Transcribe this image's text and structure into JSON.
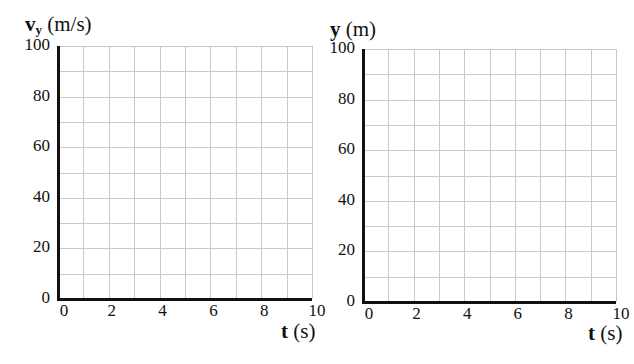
{
  "chart_data": [
    {
      "type": "line",
      "title": "",
      "ylabel": "vy (m/s)",
      "ylabel_main": "v",
      "ylabel_sub": "y",
      "ylabel_unit": "(m/s)",
      "xlabel": "t (s)",
      "xlabel_main": "t",
      "xlabel_unit": "(s)",
      "xlim": [
        0,
        10
      ],
      "ylim": [
        0,
        100
      ],
      "x_ticks": [
        "0",
        "2",
        "4",
        "6",
        "8",
        "10"
      ],
      "y_ticks": [
        "0",
        "20",
        "40",
        "60",
        "80",
        "100"
      ],
      "grid": true,
      "grid_x_step": 1,
      "grid_y_step": 10,
      "series": [],
      "note": "Blank graph grid, no plotted data"
    },
    {
      "type": "line",
      "title": "",
      "ylabel": "y (m)",
      "ylabel_main": "y",
      "ylabel_unit": "(m)",
      "xlabel": "t (s)",
      "xlabel_main": "t",
      "xlabel_unit": "(s)",
      "xlim": [
        0,
        10
      ],
      "ylim": [
        0,
        100
      ],
      "x_ticks": [
        "0",
        "2",
        "4",
        "6",
        "8",
        "10"
      ],
      "y_ticks": [
        "0",
        "20",
        "40",
        "60",
        "80",
        "100"
      ],
      "grid": true,
      "grid_x_step": 1,
      "grid_y_step": 10,
      "series": [],
      "note": "Blank graph grid, no plotted data"
    }
  ],
  "colors": {
    "grid": "#c9c9c9",
    "axis": "#111111",
    "background": "#ffffff"
  }
}
